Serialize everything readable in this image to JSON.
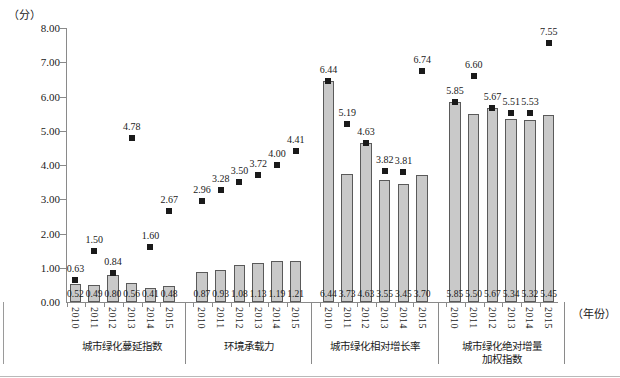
{
  "axis": {
    "y_unit": "（分）",
    "x_unit": "（年份）",
    "y_ticks": [
      "0.00",
      "1.00",
      "2.00",
      "3.00",
      "4.00",
      "5.00",
      "6.00",
      "7.00",
      "8.00"
    ],
    "y_min": 0.0,
    "y_max": 8.0
  },
  "colors": {
    "bar_fill": "#c9c9c9",
    "bar_border": "#5a5a5a",
    "marker": "#1a1a1a",
    "axis": "#8a8a8a"
  },
  "chart_data": {
    "type": "bar",
    "title": "",
    "xlabel": "（年份）",
    "ylabel": "（分）",
    "ylim": [
      0,
      8
    ],
    "grid": false,
    "legend": "none",
    "categories": [
      "2010",
      "2011",
      "2012",
      "2013",
      "2014",
      "2015",
      "2010",
      "2011",
      "2012",
      "2013",
      "2014",
      "2015",
      "2010",
      "2011",
      "2012",
      "2013",
      "2014",
      "2015",
      "2010",
      "2011",
      "2012",
      "2013",
      "2014",
      "2015"
    ],
    "groups": [
      {
        "name": "城市绿化蔓延指数",
        "years": [
          "2010",
          "2011",
          "2012",
          "2013",
          "2014",
          "2015"
        ],
        "bars": [
          0.52,
          0.49,
          0.8,
          0.56,
          0.41,
          0.48
        ],
        "bar_labels": [
          "0.52",
          "0.49",
          "0.80",
          "0.56",
          "0.41",
          "0.48"
        ],
        "points": [
          0.63,
          1.5,
          0.84,
          4.78,
          1.6,
          2.67
        ],
        "point_labels": [
          "0.63",
          "1.50",
          "0.84",
          "4.78",
          "1.60",
          "2.67"
        ]
      },
      {
        "name": "环境承载力",
        "years": [
          "2010",
          "2011",
          "2012",
          "2013",
          "2014",
          "2015"
        ],
        "bars": [
          0.87,
          0.93,
          1.08,
          1.13,
          1.19,
          1.21
        ],
        "bar_labels": [
          "0.87",
          "0.93",
          "1.08",
          "1.13",
          "1.19",
          "1.21"
        ],
        "points": [
          2.96,
          3.28,
          3.5,
          3.72,
          4.0,
          4.41
        ],
        "point_labels": [
          "2.96",
          "3.28",
          "3.50",
          "3.72",
          "4.00",
          "4.41"
        ]
      },
      {
        "name": "城市绿化相对增长率",
        "years": [
          "2010",
          "2011",
          "2012",
          "2013",
          "2014",
          "2015"
        ],
        "bars": [
          6.44,
          3.73,
          4.63,
          3.55,
          3.45,
          3.7
        ],
        "bar_labels": [
          "6.44",
          "3.73",
          "4.63",
          "3.55",
          "3.45",
          "3.70"
        ],
        "points": [
          6.44,
          5.19,
          4.63,
          3.82,
          3.81,
          6.74
        ],
        "point_labels": [
          "6.44",
          "5.19",
          "4.63",
          "3.82",
          "3.81",
          "6.74"
        ]
      },
      {
        "name": "城市绿化绝对增量\n加权指数",
        "years": [
          "2010",
          "2011",
          "2012",
          "2013",
          "2014",
          "2015"
        ],
        "bars": [
          5.85,
          5.5,
          5.67,
          5.34,
          5.32,
          5.45
        ],
        "bar_labels": [
          "5.85",
          "5.50",
          "5.67",
          "5.34",
          "5.32",
          "5.45"
        ],
        "points": [
          5.85,
          6.6,
          5.67,
          5.51,
          5.53,
          7.55
        ],
        "point_labels": [
          "5.85",
          "6.60",
          "5.67",
          "5.51",
          "5.53",
          "7.55"
        ]
      }
    ]
  }
}
